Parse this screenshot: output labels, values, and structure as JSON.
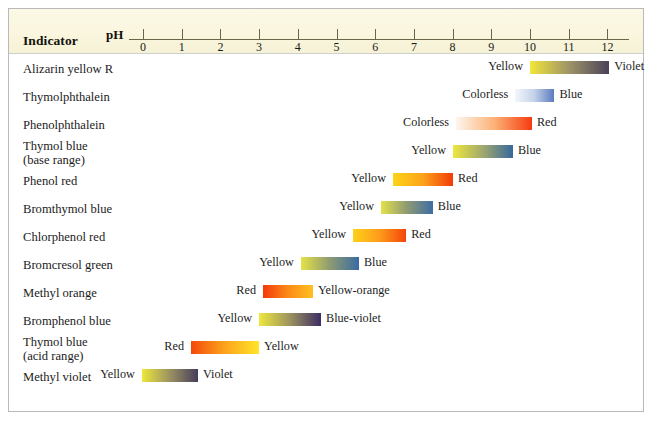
{
  "header": {
    "indicator_label": "Indicator",
    "ph_label": "pH"
  },
  "axis": {
    "ticks": [
      0,
      1,
      2,
      3,
      4,
      5,
      6,
      7,
      8,
      9,
      10,
      11,
      12
    ],
    "min": 0,
    "max": 12,
    "px_at_ph0": 142,
    "px_per_ph": 38.7
  },
  "chart_data": {
    "type": "table",
    "xlabel": "pH",
    "ylabel": "",
    "xlim": [
      0,
      12
    ],
    "grid": false,
    "legend": "none",
    "categories": [
      "Alizarin yellow R",
      "Thymolphthalein",
      "Phenolphthalein",
      "Thymol blue (base range)",
      "Phenol red",
      "Bromthymol blue",
      "Chlorphenol red",
      "Bromcresol green",
      "Methyl orange",
      "Bromphenol blue",
      "Thymol blue (acid range)",
      "Methyl violet"
    ],
    "rows": [
      {
        "name": "Alizarin yellow R",
        "name_line2": "",
        "acid_label": "Yellow",
        "base_label": "Violet",
        "ph_start": 10.0,
        "ph_end": 12.05,
        "color_start": "#f2e63a",
        "color_mid": "#9d9368",
        "color_end": "#4a4258"
      },
      {
        "name": "Thymolphthalein",
        "name_line2": "",
        "acid_label": "Colorless",
        "base_label": "Blue",
        "ph_start": 9.62,
        "ph_end": 10.63,
        "color_start": "#f4f7fc",
        "color_mid": "#c3d1e8",
        "color_end": "#5a7cc0"
      },
      {
        "name": "Phenolphthalein",
        "name_line2": "",
        "acid_label": "Colorless",
        "base_label": "Red",
        "ph_start": 8.09,
        "ph_end": 10.05,
        "color_start": "#fdf6ef",
        "color_mid": "#fcb277",
        "color_end": "#f63c10"
      },
      {
        "name": "Thymol blue",
        "name_line2": "(base range)",
        "acid_label": "Yellow",
        "base_label": "Blue",
        "ph_start": 8.01,
        "ph_end": 9.56,
        "color_start": "#eee73f",
        "color_mid": "#a0a86d",
        "color_end": "#35689e"
      },
      {
        "name": "Phenol red",
        "name_line2": "",
        "acid_label": "Yellow",
        "base_label": "Red",
        "ph_start": 6.46,
        "ph_end": 8.01,
        "color_start": "#ffd417",
        "color_mid": "#fca31b",
        "color_end": "#f23c07"
      },
      {
        "name": "Bromthymol blue",
        "name_line2": "",
        "acid_label": "Yellow",
        "base_label": "Blue",
        "ph_start": 6.15,
        "ph_end": 7.49,
        "color_start": "#e4e14a",
        "color_mid": "#8e9a72",
        "color_end": "#3d6da4"
      },
      {
        "name": "Chlorphenol red",
        "name_line2": "",
        "acid_label": "Yellow",
        "base_label": "Red",
        "ph_start": 5.43,
        "ph_end": 6.8,
        "color_start": "#ffd01b",
        "color_mid": "#fd9c1a",
        "color_end": "#f4460b"
      },
      {
        "name": "Bromcresol green",
        "name_line2": "",
        "acid_label": "Yellow",
        "base_label": "Blue",
        "ph_start": 4.08,
        "ph_end": 5.58,
        "color_start": "#e5e246",
        "color_mid": "#8d9a72",
        "color_end": "#3a6ba2"
      },
      {
        "name": "Methyl orange",
        "name_line2": "",
        "acid_label": "Red",
        "base_label": "Yellow-orange",
        "ph_start": 3.1,
        "ph_end": 4.39,
        "color_start": "#f4390a",
        "color_mid": "#fb8b17",
        "color_end": "#ffc021"
      },
      {
        "name": "Bromphenol blue",
        "name_line2": "",
        "acid_label": "Yellow",
        "base_label": "Blue-violet",
        "ph_start": 3.0,
        "ph_end": 4.6,
        "color_start": "#eee83c",
        "color_mid": "#9b9260",
        "color_end": "#3c2d63"
      },
      {
        "name": "Thymol blue",
        "name_line2": "(acid range)",
        "acid_label": "Red",
        "base_label": "Yellow",
        "ph_start": 1.24,
        "ph_end": 3.0,
        "color_start": "#f3490b",
        "color_mid": "#fca41c",
        "color_end": "#ffe52a"
      },
      {
        "name": "Methyl violet",
        "name_line2": "",
        "acid_label": "Yellow",
        "base_label": "Violet",
        "ph_start": -0.03,
        "ph_end": 1.42,
        "color_start": "#eee73c",
        "color_mid": "#9a9162",
        "color_end": "#463e5a"
      }
    ]
  },
  "colors": {
    "header_background": "#faf6df",
    "frame_border": "#b9b9b9",
    "axis_line": "#6a6448",
    "text": "#1c1c1c"
  }
}
